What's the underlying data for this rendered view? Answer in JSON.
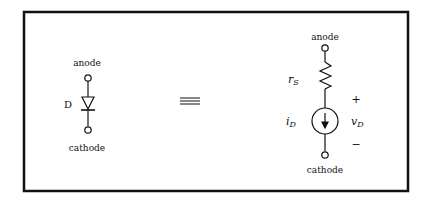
{
  "left": {
    "anode_label": "anode",
    "cathode_label": "cathode",
    "device_label": "D"
  },
  "equivalence_symbol": "≡",
  "right": {
    "anode_label": "anode",
    "cathode_label": "cathode",
    "resistor_label": "r",
    "resistor_sub": "S",
    "current_label": "i",
    "current_sub": "D",
    "voltage_label": "v",
    "voltage_sub": "D",
    "plus": "+",
    "minus": "−"
  }
}
